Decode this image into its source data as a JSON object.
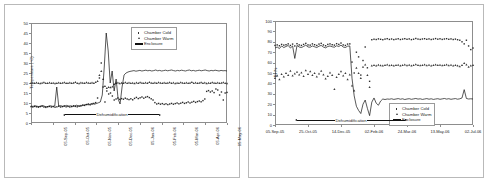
{
  "document": {
    "kind": "two-panel-scientific-figure",
    "panel_count": 2
  },
  "chart_data": [
    {
      "id": "temperature-chart",
      "type": "line",
      "title": "",
      "xlabel": "",
      "ylabel": "Temperature (°C)",
      "ylim": [
        0,
        50
      ],
      "ytick_step": 5,
      "yticks": [
        0,
        5,
        10,
        15,
        20,
        25,
        30,
        35,
        40,
        45,
        50
      ],
      "xticks": [
        "05-Sep-05",
        "05-Oct-05",
        "05-Nov-05",
        "05-Dec-05",
        "05-Jan-06",
        "05-Feb-06",
        "05-Mar-06",
        "05-Apr-06",
        "05-May-06",
        "05-Jun-06"
      ],
      "grid": false,
      "legend_position": "top-right",
      "legend": [
        "Chamber Cold",
        "Chamber Warm",
        "Enclosure"
      ],
      "annotations": [
        {
          "text": "Dehumidification",
          "style": "double-headed-arrow",
          "y_value": 4
        }
      ],
      "series": [
        {
          "name": "Chamber Cold",
          "marker": "square",
          "values": [
            8.2,
            8.0,
            8.3,
            8.1,
            7.9,
            8.2,
            8.4,
            8.0,
            7.8,
            8.1,
            8.3,
            8.0,
            8.2,
            7.9,
            8.1,
            8.4,
            8.0,
            8.2,
            8.5,
            8.1,
            8.3,
            8.0,
            8.2,
            8.6,
            8.3,
            8.1,
            8.4,
            8.7,
            9.0,
            8.8,
            9.2,
            9.5,
            9.1,
            9.4,
            9.8,
            10.2,
            12.5,
            22.5,
            30.0,
            18.0,
            10.5,
            16.0,
            14.5,
            15.0,
            13.5,
            11.5,
            12.0,
            12.5,
            11.8,
            12.2,
            11.9,
            12.4,
            12.0,
            11.7,
            12.1,
            11.6,
            12.3,
            12.8,
            12.2,
            12.6,
            13.0,
            12.4,
            12.9,
            13.2,
            12.7,
            12.1,
            11.5,
            10.2,
            9.5,
            9.8,
            9.4,
            9.7,
            9.3,
            9.6,
            9.2,
            9.5,
            9.8,
            9.4,
            9.7,
            10.0,
            9.6,
            9.9,
            10.3,
            9.8,
            10.1,
            10.5,
            10.0,
            10.4,
            10.8,
            10.3,
            10.7,
            11.0,
            10.6,
            11.2,
            12.0,
            15.8,
            16.2,
            15.5,
            16.0,
            15.2,
            17.0,
            16.5,
            14.0,
            15.5,
            11.5,
            15.0,
            15.3
          ]
        },
        {
          "name": "Chamber Warm",
          "marker": "triangle",
          "values": [
            20.0,
            20.1,
            19.9,
            20.2,
            20.0,
            19.8,
            20.1,
            20.3,
            20.0,
            19.9,
            20.2,
            20.0,
            20.1,
            19.8,
            20.0,
            20.2,
            19.9,
            20.1,
            20.3,
            20.0,
            19.9,
            20.2,
            20.0,
            20.1,
            20.4,
            20.0,
            19.8,
            20.2,
            20.1,
            20.0,
            20.3,
            20.1,
            19.9,
            20.2,
            20.0,
            20.4,
            21.0,
            24.0,
            26.0,
            22.0,
            18.5,
            17.5,
            18.0,
            17.8,
            18.2,
            19.5,
            20.0,
            20.2,
            19.8,
            20.1,
            20.0,
            20.3,
            19.9,
            20.2,
            20.0,
            20.1,
            19.8,
            20.2,
            20.0,
            20.3,
            20.1,
            19.9,
            20.2,
            20.0,
            20.4,
            20.1,
            19.9,
            20.2,
            20.0,
            20.3,
            20.1,
            20.0,
            20.2,
            19.9,
            20.1,
            20.3,
            20.0,
            20.2,
            19.8,
            20.1,
            20.0,
            20.3,
            20.1,
            19.9,
            20.2,
            20.0,
            20.1,
            20.4,
            20.0,
            20.2,
            19.9,
            20.1,
            20.3,
            20.0,
            20.2,
            19.8,
            20.1,
            20.0,
            20.3,
            20.1,
            19.9,
            20.2,
            20.0,
            20.1,
            20.3,
            20.0,
            19.8
          ]
        },
        {
          "name": "Enclosure",
          "marker": "line",
          "values": [
            8.5,
            8.3,
            8.6,
            8.4,
            8.2,
            8.5,
            8.7,
            8.3,
            8.1,
            8.4,
            8.6,
            8.3,
            8.5,
            18.0,
            8.4,
            8.7,
            8.3,
            8.5,
            8.8,
            8.4,
            8.6,
            8.3,
            8.5,
            8.9,
            8.6,
            8.4,
            8.7,
            9.0,
            9.3,
            9.1,
            9.5,
            9.8,
            9.4,
            9.7,
            10.1,
            10.5,
            14.0,
            28.0,
            45.0,
            36.0,
            20.0,
            26.0,
            16.0,
            22.0,
            12.0,
            9.5,
            18.0,
            24.0,
            25.0,
            25.5,
            25.8,
            26.0,
            26.2,
            25.9,
            26.1,
            26.3,
            26.0,
            26.2,
            26.4,
            26.1,
            26.3,
            26.0,
            26.2,
            26.5,
            26.1,
            26.3,
            26.0,
            26.2,
            26.4,
            26.1,
            26.3,
            26.5,
            26.2,
            26.0,
            26.3,
            26.1,
            26.4,
            26.2,
            26.0,
            26.3,
            26.5,
            26.1,
            26.3,
            26.0,
            26.2,
            26.4,
            26.1,
            26.3,
            26.5,
            26.2,
            26.0,
            26.3,
            26.1,
            26.4,
            26.2,
            26.0,
            26.3,
            26.1,
            26.2,
            26.0
          ]
        }
      ]
    },
    {
      "id": "humidity-chart",
      "type": "line",
      "title": "",
      "xlabel": "",
      "ylabel": "RH%",
      "ylim": [
        0,
        100
      ],
      "ytick_step": 10,
      "yticks": [
        0,
        10,
        20,
        30,
        40,
        50,
        60,
        70,
        80,
        90,
        100
      ],
      "xticks": [
        "05-Sep-05",
        "25-Oct-05",
        "14-Dec-05",
        "02-Feb-06",
        "24-Mar-06",
        "13-May-06",
        "02-Jul-06"
      ],
      "grid": false,
      "legend_position": "bottom-right",
      "legend": [
        "Chamber Cold",
        "Chamber Warm",
        "Enclosure"
      ],
      "annotations": [
        {
          "text": "Dehumidification",
          "style": "double-headed-arrow",
          "y_value": 4
        }
      ],
      "series": [
        {
          "name": "Chamber Cold",
          "marker": "square",
          "values": [
            76.5,
            77.0,
            76.2,
            77.5,
            76.8,
            77.2,
            78.0,
            76.5,
            77.8,
            76.0,
            78.2,
            77.0,
            76.5,
            77.5,
            78.5,
            77.0,
            76.8,
            78.0,
            77.2,
            76.5,
            77.8,
            78.5,
            77.0,
            76.2,
            77.5,
            78.0,
            77.2,
            76.8,
            78.2,
            77.5,
            78.8,
            77.0,
            76.5,
            77.8,
            78.0,
            60.5,
            50.0,
            70.0,
            65.5,
            48.0,
            62.0,
            75.0,
            55.0,
            42.0,
            82.0,
            82.5,
            82.2,
            82.8,
            82.4,
            82.0,
            82.6,
            83.0,
            82.3,
            82.7,
            82.1,
            82.5,
            82.9,
            82.2,
            82.6,
            83.0,
            82.4,
            82.8,
            82.1,
            82.5,
            83.2,
            82.6,
            82.3,
            82.7,
            83.0,
            82.4,
            82.8,
            82.2,
            82.6,
            83.1,
            82.5,
            82.9,
            82.3,
            82.7,
            83.0,
            82.4,
            82.8,
            82.2,
            82.6,
            82.0,
            81.5,
            80.0,
            78.0,
            81.5,
            76.0,
            72.5,
            74.0
          ]
        },
        {
          "name": "Chamber Warm",
          "marker": "triangle",
          "values": [
            45.0,
            47.5,
            44.0,
            49.0,
            46.5,
            50.0,
            48.0,
            52.0,
            47.5,
            49.5,
            51.0,
            48.5,
            50.5,
            47.0,
            52.5,
            49.0,
            51.5,
            48.0,
            50.0,
            46.5,
            49.5,
            52.0,
            48.5,
            44.5,
            47.0,
            50.5,
            48.0,
            34.5,
            46.0,
            49.0,
            51.5,
            47.5,
            50.0,
            44.0,
            48.5,
            38.0,
            33.0,
            55.0,
            50.0,
            45.0,
            56.0,
            58.0,
            48.0,
            36.5,
            57.0,
            57.5,
            57.2,
            57.8,
            57.4,
            57.0,
            57.6,
            58.0,
            57.3,
            57.7,
            57.1,
            57.5,
            57.9,
            57.2,
            57.6,
            58.0,
            57.4,
            57.8,
            57.1,
            57.5,
            58.2,
            57.6,
            57.3,
            57.7,
            58.0,
            57.4,
            57.8,
            57.2,
            57.6,
            58.1,
            57.5,
            57.9,
            57.3,
            57.7,
            58.0,
            57.4,
            57.8,
            57.2,
            57.6,
            57.0,
            56.5,
            57.5,
            59.5,
            58.0,
            56.0,
            57.0,
            57.5
          ]
        },
        {
          "name": "Enclosure",
          "marker": "line",
          "values": [
            74.0,
            75.0,
            73.5,
            76.0,
            74.5,
            75.5,
            76.5,
            74.0,
            76.0,
            64.0,
            76.5,
            75.0,
            74.5,
            75.5,
            76.8,
            75.0,
            74.8,
            76.0,
            75.2,
            74.5,
            75.8,
            76.5,
            75.0,
            74.2,
            75.5,
            76.0,
            75.2,
            74.8,
            76.2,
            75.5,
            76.8,
            75.0,
            74.5,
            75.8,
            76.0,
            45.0,
            28.0,
            18.0,
            14.0,
            11.0,
            20.0,
            24.0,
            16.0,
            9.0,
            22.0,
            26.0,
            21.0,
            19.0,
            23.0,
            25.0,
            24.5,
            25.0,
            24.8,
            25.2,
            24.6,
            25.0,
            25.4,
            24.8,
            25.2,
            24.5,
            25.0,
            25.3,
            24.7,
            25.1,
            25.5,
            24.9,
            25.2,
            24.6,
            25.0,
            25.4,
            24.8,
            25.2,
            24.6,
            25.0,
            25.3,
            24.7,
            25.1,
            25.5,
            24.9,
            25.3,
            24.7,
            25.1,
            25.4,
            24.8,
            25.2,
            26.0,
            34.0,
            25.5,
            25.0,
            25.2,
            25.0
          ]
        }
      ]
    }
  ]
}
